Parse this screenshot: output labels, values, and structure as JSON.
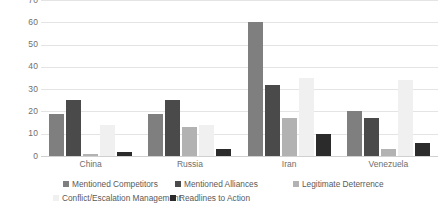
{
  "chart_data": {
    "type": "bar",
    "title": "",
    "subtitle": "",
    "xlabel": "",
    "ylabel": "",
    "ylim": [
      0,
      70
    ],
    "ytick_step": 10,
    "yticks": [
      "70",
      "60",
      "50",
      "40",
      "30",
      "20",
      "10",
      "0"
    ],
    "grid": true,
    "legend_position": "bottom",
    "categories": [
      "China",
      "Russia",
      "Iran",
      "Venezuela"
    ],
    "series": [
      {
        "name": "Mentioned Competitors",
        "color": "#7f7f7f",
        "values": [
          19,
          19,
          60,
          20
        ]
      },
      {
        "name": "Mentioned Alliances",
        "color": "#4a4a4a",
        "values": [
          25,
          25,
          32,
          17
        ]
      },
      {
        "name": "Legitimate Deterrence",
        "color": "#b2b2b2",
        "values": [
          1,
          13,
          17,
          3
        ]
      },
      {
        "name": "Conflict/Escalation Management",
        "color": "#f0f0f0",
        "values": [
          14,
          14,
          35,
          34
        ]
      },
      {
        "name": "Readlines to Action",
        "color": "#2b2b2b",
        "values": [
          2,
          3,
          10,
          6
        ]
      }
    ]
  },
  "axis": {
    "y_labels": [
      "70",
      "60",
      "50",
      "40",
      "30",
      "20",
      "10",
      "0"
    ],
    "x_labels": [
      "China",
      "Russia",
      "Iran",
      "Venezuela"
    ]
  },
  "legend": {
    "items": [
      {
        "label": "Mentioned Competitors",
        "color": "#7f7f7f"
      },
      {
        "label": "Mentioned Alliances",
        "color": "#4a4a4a"
      },
      {
        "label": "Legitimate Deterrence",
        "color": "#b2b2b2"
      },
      {
        "label": "Conflict/Escalation Management",
        "color": "#f0f0f0"
      },
      {
        "label": "Readlines to Action",
        "color": "#2b2b2b"
      }
    ]
  }
}
